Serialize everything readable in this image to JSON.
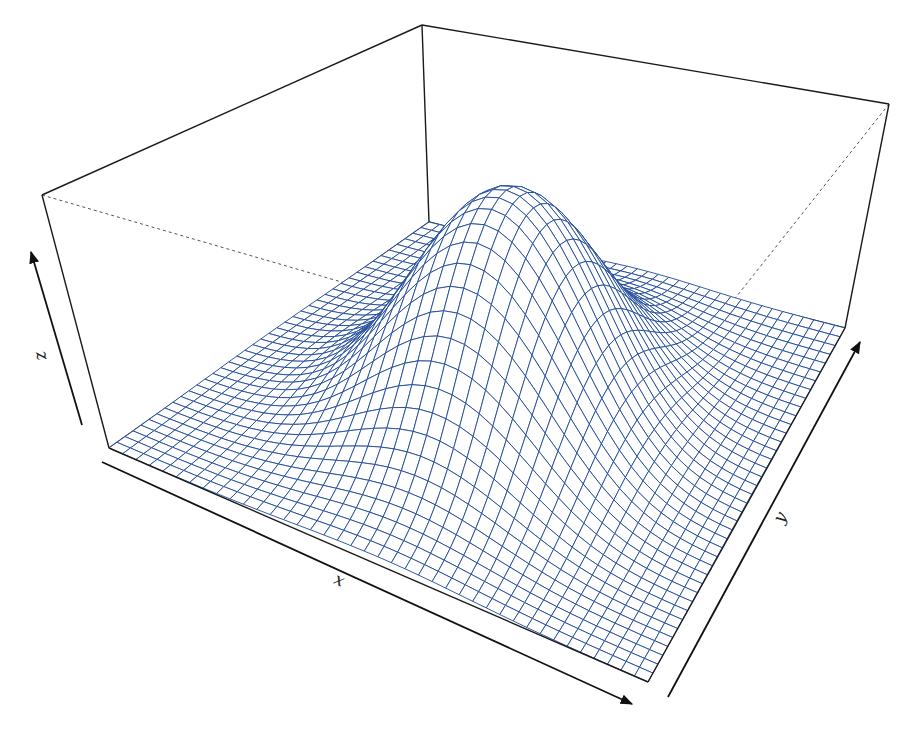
{
  "chart_data": {
    "type": "surface3d",
    "title": "",
    "xlabel": "x",
    "ylabel": "y",
    "zlabel": "z",
    "grid_resolution": [
      40,
      40
    ],
    "surface": {
      "shape": "gaussian-bump",
      "peak_location": {
        "x": 0.5,
        "y": 0.5
      },
      "peak_height_fraction_of_box": 0.94,
      "base_level": 0.0,
      "sigma_x": 0.16,
      "sigma_y": 0.19
    },
    "ticks": "none",
    "box": true
  },
  "style": {
    "mesh_color": "#1f4a99",
    "box_color": "#1a1a1a",
    "hidden_edge_color": "#555555",
    "background": "#ffffff"
  },
  "projection": {
    "base": {
      "left": [
        109,
        448
      ],
      "back": [
        429,
        222
      ],
      "right": [
        845,
        328
      ],
      "front": [
        648,
        682
      ]
    },
    "top": {
      "left": [
        42,
        195
      ],
      "back": [
        422,
        25
      ],
      "right": [
        889,
        104
      ],
      "front": [
        672,
        378
      ]
    }
  },
  "axes": {
    "x": {
      "label": "x",
      "from": [
        102,
        462
      ],
      "to": [
        632,
        704
      ],
      "label_pos": [
        337,
        585
      ]
    },
    "y": {
      "label": "y",
      "from": [
        668,
        697
      ],
      "to": [
        860,
        342
      ],
      "label_pos": [
        785,
        520
      ]
    },
    "z": {
      "label": "z",
      "from": [
        82,
        425
      ],
      "to": [
        31,
        252
      ],
      "label_pos": [
        37,
        357
      ]
    }
  }
}
